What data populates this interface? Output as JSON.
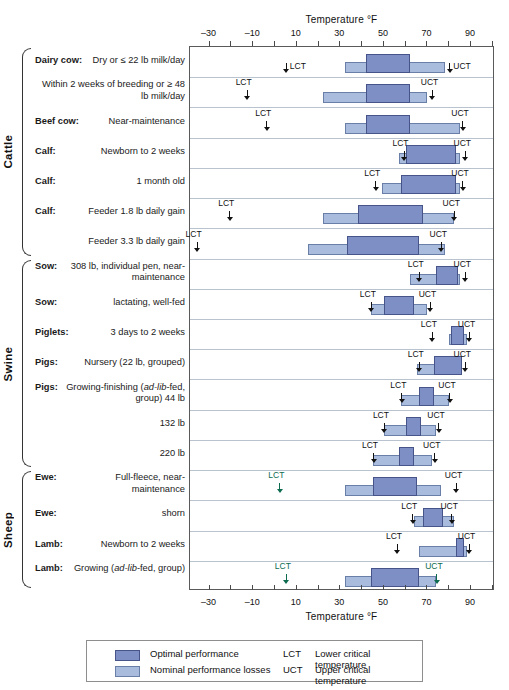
{
  "axis": {
    "title": "Temperature °F",
    "ticks": [
      -30,
      -10,
      10,
      30,
      50,
      70,
      90
    ],
    "tick_labels": [
      "–30",
      "–10",
      "10",
      "30",
      "50",
      "70",
      "90"
    ],
    "minor_step": 10,
    "range": [
      -39,
      101
    ]
  },
  "legend": {
    "items": [
      {
        "swatch": "optimal",
        "label": "Optimal performance"
      },
      {
        "swatch": "nominal",
        "label": "Nominal performance losses"
      }
    ],
    "abbrevs": [
      {
        "abbr": "LCT",
        "definition": "Lower critical temperature"
      },
      {
        "abbr": "UCT",
        "definition": "Upper critical temperature"
      }
    ]
  },
  "colors": {
    "optimal": "#7d8fc4",
    "optimal_border": "#46548a",
    "nominal": "#a9bcdd",
    "nominal_border": "#6a7fa8",
    "frame": "#5a5a5a",
    "rowsep": "#b9c3cf",
    "marker": "#111111",
    "marker_green": "#0d6b4f"
  },
  "groups": [
    {
      "name": "Cattle",
      "first_row": 0,
      "last_row": 6
    },
    {
      "name": "Swine",
      "first_row": 7,
      "last_row": 13
    },
    {
      "name": "Sheep",
      "first_row": 14,
      "last_row": 17
    }
  ],
  "chart_data": {
    "type": "bar",
    "title": "Temperature °F",
    "xlabel": "Temperature °F",
    "ylabel": "",
    "xlim": [
      -39,
      101
    ],
    "grid": false,
    "legend_position": "bottom",
    "series": [
      {
        "name": "Optimal performance",
        "color": "#7d8fc4"
      },
      {
        "name": "Nominal performance losses",
        "color": "#a9bcdd"
      }
    ],
    "rows": [
      {
        "group": "Cattle",
        "lead": "Dairy cow:",
        "detail": "Dry or ≤ 22 lb milk/day",
        "nominal": [
          32,
          78
        ],
        "optimal": [
          42,
          62
        ],
        "lct": 5,
        "lct_label": "LCT",
        "lct_style": "inline",
        "uct": 80,
        "uct_label": "UCT",
        "uct_style": "inline"
      },
      {
        "group": "Cattle",
        "lead": "",
        "detail": "Within 2 weeks of breeding or ≥ 48 lb milk/day",
        "nominal": [
          22,
          70
        ],
        "optimal": [
          42,
          62
        ],
        "lct": -13,
        "lct_label": "LCT",
        "lct_style": "above",
        "uct": 72,
        "uct_label": "UCT",
        "uct_style": "above"
      },
      {
        "group": "Cattle",
        "lead": "Beef cow:",
        "detail": "Near-maintenance",
        "nominal": [
          32,
          85
        ],
        "optimal": [
          42,
          62
        ],
        "lct": -4,
        "lct_label": "LCT",
        "lct_style": "above",
        "uct": 86,
        "uct_label": "UCT",
        "uct_style": "above"
      },
      {
        "group": "Cattle",
        "lead": "Calf:",
        "detail": "Newborn to 2 weeks",
        "nominal": [
          57,
          85
        ],
        "optimal": [
          60,
          83
        ],
        "lct": 59,
        "lct_label": "LCT",
        "lct_style": "above",
        "uct": 87,
        "uct_label": "UCT",
        "uct_style": "above"
      },
      {
        "group": "Cattle",
        "lead": "Calf:",
        "detail": "1 month old",
        "nominal": [
          49,
          85
        ],
        "optimal": [
          58,
          83
        ],
        "lct": 46,
        "lct_label": "LCT",
        "lct_style": "above",
        "uct": 86,
        "uct_label": "UCT",
        "uct_style": "above"
      },
      {
        "group": "Cattle",
        "lead": "Calf:",
        "detail": "Feeder 1.8 lb daily gain",
        "nominal": [
          22,
          82
        ],
        "optimal": [
          38,
          68
        ],
        "lct": -21,
        "lct_label": "LCT",
        "lct_style": "above",
        "uct": 82,
        "uct_label": "UCT",
        "uct_style": "above"
      },
      {
        "group": "Cattle",
        "lead": "",
        "detail": "Feeder 3.3 lb daily gain",
        "nominal": [
          15,
          78
        ],
        "optimal": [
          33,
          66
        ],
        "lct": -36,
        "lct_label": "LCT",
        "lct_style": "above",
        "uct": 76,
        "uct_label": "UCT",
        "uct_style": "above"
      },
      {
        "group": "Swine",
        "lead": "Sow:",
        "detail": "308 lb, individual pen, near-maintenance",
        "nominal": [
          62,
          85
        ],
        "optimal": [
          74,
          84
        ],
        "lct": 66,
        "lct_label": "LCT",
        "lct_style": "above",
        "uct": 87,
        "uct_label": "UCT",
        "uct_style": "above"
      },
      {
        "group": "Swine",
        "lead": "Sow:",
        "detail": "lactating, well-fed",
        "nominal": [
          44,
          70
        ],
        "optimal": [
          50,
          64
        ],
        "lct": 44,
        "lct_label": "LCT",
        "lct_style": "above",
        "uct": 71,
        "uct_label": "UCT",
        "uct_style": "above"
      },
      {
        "group": "Swine",
        "lead": "Piglets:",
        "detail": "3 days to 2 weeks",
        "nominal": [
          80,
          88
        ],
        "optimal": [
          81,
          87
        ],
        "lct": 72,
        "lct_label": "LCT",
        "lct_style": "above",
        "uct": 89,
        "uct_label": "UCT",
        "uct_style": "above"
      },
      {
        "group": "Swine",
        "lead": "Pigs:",
        "detail": "Nursery (22 lb, grouped)",
        "nominal": [
          65,
          86
        ],
        "optimal": [
          73,
          86
        ],
        "lct": 66,
        "lct_label": "LCT",
        "lct_style": "above",
        "uct": 87,
        "uct_label": "UCT",
        "uct_style": "above"
      },
      {
        "group": "Swine",
        "lead": "Pigs:",
        "detail": "Growing-finishing (ad-lib-fed, group) 44 lb",
        "detail_italic": "ad-lib",
        "nominal": [
          58,
          80
        ],
        "optimal": [
          66,
          73
        ],
        "lct": 58,
        "lct_label": "LCT",
        "lct_style": "above",
        "uct": 80,
        "uct_label": "UCT",
        "uct_style": "above"
      },
      {
        "group": "Swine",
        "lead": "",
        "detail": "132 lb",
        "nominal": [
          50,
          74
        ],
        "optimal": [
          60,
          67
        ],
        "lct": 50,
        "lct_label": "LCT",
        "lct_style": "above",
        "uct": 75,
        "uct_label": "UCT",
        "uct_style": "above"
      },
      {
        "group": "Swine",
        "lead": "",
        "detail": "220 lb",
        "nominal": [
          45,
          72
        ],
        "optimal": [
          57,
          64
        ],
        "lct": 45,
        "lct_label": "LCT",
        "lct_style": "above",
        "uct": 73,
        "uct_label": "UCT",
        "uct_style": "above"
      },
      {
        "group": "Sheep",
        "lead": "Ewe:",
        "detail": "Full-fleece, near-maintenance",
        "nominal": [
          32,
          76
        ],
        "optimal": [
          45,
          65
        ],
        "lct": 2,
        "lct_label": "LCT",
        "lct_style": "above",
        "lct_color": "green",
        "uct": 83,
        "uct_label": "UCT",
        "uct_style": "above"
      },
      {
        "group": "Sheep",
        "lead": "Ewe:",
        "detail": "shorn",
        "nominal": [
          64,
          82
        ],
        "optimal": [
          68,
          77
        ],
        "lct": 63,
        "lct_label": "LCT",
        "lct_style": "above",
        "uct": 81,
        "uct_label": "UCT",
        "uct_style": "above"
      },
      {
        "group": "Sheep",
        "lead": "Lamb:",
        "detail": "Newborn to 2 weeks",
        "nominal": [
          66,
          88
        ],
        "optimal": [
          83,
          87
        ],
        "lct": 56,
        "lct_label": "LCT",
        "lct_style": "above",
        "uct": 89,
        "uct_label": "UCT",
        "uct_style": "above"
      },
      {
        "group": "Sheep",
        "lead": "Lamb:",
        "detail": "Growing (ad-lib-fed, group)",
        "detail_italic": "ad-lib",
        "nominal": [
          32,
          74
        ],
        "optimal": [
          44,
          66
        ],
        "lct": 5,
        "lct_label": "LCT",
        "lct_style": "above",
        "lct_color": "green",
        "uct": 74,
        "uct_label": "UCT",
        "uct_style": "above",
        "uct_color": "green"
      }
    ]
  }
}
